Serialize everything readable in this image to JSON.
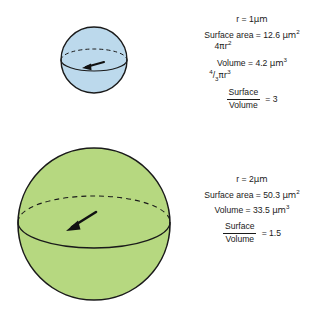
{
  "figure": {
    "background_color": "#ffffff"
  },
  "spheres": [
    {
      "id": "small-sphere",
      "label": "small sphere r = 1 um",
      "fill_color": "#bcd9ec",
      "stroke_color": "#1a1a1a",
      "center_x": 94,
      "center_y": 60,
      "radius": 33,
      "radius_arrow": "radius-arrow-small"
    },
    {
      "id": "large-sphere",
      "label": "large sphere r = 2 um",
      "fill_color": "#b6d880",
      "stroke_color": "#1a1a1a",
      "center_x": 94,
      "center_y": 224,
      "radius": 76,
      "radius_arrow": "radius-arrow-large"
    }
  ],
  "small": {
    "radius_line": "r = 1μm",
    "radius_label": "r",
    "radius_eq": " = 1",
    "radius_unit": "μm",
    "surface_label": "Surface area = 12.6 ",
    "surface_value": "12.6",
    "surface_unit": "μm",
    "surface_exp": "2",
    "surface_formula_coeff": "4",
    "surface_formula_pi": "πr",
    "surface_formula_exp": "2",
    "volume_label": "Volume = 4.2 ",
    "volume_value": "4.2",
    "volume_unit": "μm",
    "volume_exp": "3",
    "volume_formula_num": "4",
    "volume_formula_den": "3",
    "volume_formula_pi": "πr",
    "volume_formula_exp": "3",
    "ratio_numer": "Surface",
    "ratio_denom": "Volume",
    "ratio_eq": "= 3",
    "ratio_value": "3"
  },
  "large": {
    "radius_line": "r = 2μm",
    "radius_label": "r",
    "radius_eq": " = 2",
    "radius_unit": "μm",
    "surface_label": "Surface area = 50.3 ",
    "surface_value": "50.3",
    "surface_unit": "μm",
    "surface_exp": "2",
    "volume_label": "Volume = 33.5 ",
    "volume_value": "33.5",
    "volume_unit": "μm",
    "volume_exp": "3",
    "ratio_numer": "Surface",
    "ratio_denom": "Volume",
    "ratio_eq": "= 1.5",
    "ratio_value": "1.5"
  }
}
